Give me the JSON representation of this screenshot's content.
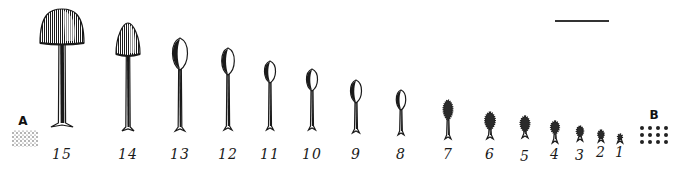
{
  "figure": {
    "panel_labels": {
      "a": "A",
      "b": "B"
    },
    "scale_bar": {
      "x1": 555,
      "x2": 609,
      "y": 20
    },
    "colors": {
      "ink": "#1a1a1a",
      "background": "#ffffff"
    },
    "stages": [
      {
        "label": "15",
        "cx": 62,
        "capTop": 9,
        "capBot": 43,
        "capW": 44,
        "base": 127,
        "labelY": 146,
        "shape": "dome"
      },
      {
        "label": "14",
        "cx": 128,
        "capTop": 23,
        "capBot": 55,
        "capW": 24,
        "base": 131,
        "labelY": 146,
        "shape": "cone"
      },
      {
        "label": "13",
        "cx": 180,
        "capTop": 38,
        "capBot": 70,
        "capW": 19,
        "base": 131,
        "labelY": 146,
        "shape": "ovoid"
      },
      {
        "label": "12",
        "cx": 228,
        "capTop": 48,
        "capBot": 75,
        "capW": 16,
        "base": 130,
        "labelY": 146,
        "shape": "ovoid"
      },
      {
        "label": "11",
        "cx": 270,
        "capTop": 61,
        "capBot": 83,
        "capW": 14,
        "base": 130,
        "labelY": 146,
        "shape": "ovoid"
      },
      {
        "label": "10",
        "cx": 312,
        "capTop": 69,
        "capBot": 91,
        "capW": 14,
        "base": 130,
        "labelY": 146,
        "shape": "ovoid"
      },
      {
        "label": "9",
        "cx": 356,
        "capTop": 80,
        "capBot": 103,
        "capW": 14,
        "base": 133,
        "labelY": 146,
        "shape": "ovoid"
      },
      {
        "label": "8",
        "cx": 401,
        "capTop": 90,
        "capBot": 110,
        "capW": 12,
        "base": 135,
        "labelY": 146,
        "shape": "ovoid"
      },
      {
        "label": "7",
        "cx": 448,
        "capTop": 100,
        "capBot": 120,
        "capW": 12,
        "base": 139,
        "labelY": 146,
        "shape": "hairy"
      },
      {
        "label": "6",
        "cx": 490,
        "capTop": 112,
        "capBot": 130,
        "capW": 13,
        "base": 139,
        "labelY": 146,
        "shape": "hairy"
      },
      {
        "label": "5",
        "cx": 525,
        "capTop": 116,
        "capBot": 132,
        "capW": 12,
        "base": 138,
        "labelY": 148,
        "shape": "hairy"
      },
      {
        "label": "4",
        "cx": 555,
        "capTop": 121,
        "capBot": 134,
        "capW": 11,
        "base": 143,
        "labelY": 146,
        "shape": "hairy"
      },
      {
        "label": "3",
        "cx": 580,
        "capTop": 126,
        "capBot": 137,
        "capW": 9,
        "base": 141,
        "labelY": 147,
        "shape": "hairy"
      },
      {
        "label": "2",
        "cx": 601,
        "capTop": 130,
        "capBot": 139,
        "capW": 8,
        "base": 142,
        "labelY": 144,
        "shape": "hairy"
      },
      {
        "label": "1",
        "cx": 620,
        "capTop": 134,
        "capBot": 140,
        "capW": 6,
        "base": 143,
        "labelY": 144,
        "shape": "hairy"
      }
    ]
  }
}
